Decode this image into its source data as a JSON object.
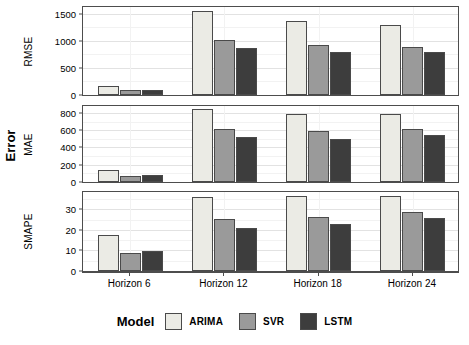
{
  "chart_data": {
    "type": "bar",
    "title": "",
    "subtitle": "",
    "xlabel": "",
    "ylabel": "Error",
    "grid": true,
    "legend": {
      "title": "Model",
      "position": "bottom",
      "entries": [
        {
          "name": "ARIMA",
          "color": "#ebebe5"
        },
        {
          "name": "SVR",
          "color": "#9a9a9a"
        },
        {
          "name": "LSTM",
          "color": "#3d3d3d"
        }
      ]
    },
    "categories": [
      "Horizon 6",
      "Horizon 12",
      "Horizon 18",
      "Horizon 24"
    ],
    "facets": [
      {
        "name": "RMSE",
        "ylim": [
          0,
          1620
        ],
        "ticks": [
          0,
          500,
          1000,
          1500
        ],
        "tick_labels": [
          "0",
          "500",
          "1000",
          "1500"
        ],
        "minor_ticks": [
          250,
          750,
          1250
        ],
        "series": [
          {
            "name": "ARIMA",
            "values": [
              175,
              1540,
              1365,
              1285
            ]
          },
          {
            "name": "SVR",
            "values": [
              95,
              1015,
              915,
              890
            ]
          },
          {
            "name": "LSTM",
            "values": [
              90,
              870,
              790,
              795
            ]
          }
        ]
      },
      {
        "name": "MAE",
        "ylim": [
          0,
          880
        ],
        "ticks": [
          0,
          200,
          400,
          600,
          800
        ],
        "tick_labels": [
          "0",
          "200",
          "400",
          "600",
          "800"
        ],
        "minor_ticks": [
          100,
          300,
          500,
          700
        ],
        "series": [
          {
            "name": "ARIMA",
            "values": [
              140,
              850,
              785,
              788
            ]
          },
          {
            "name": "SVR",
            "values": [
              75,
              618,
              590,
              618
            ]
          },
          {
            "name": "LSTM",
            "values": [
              80,
              520,
              500,
              540
            ]
          }
        ]
      },
      {
        "name": "SMAPE",
        "ylim": [
          0,
          38.5
        ],
        "ticks": [
          0,
          10,
          20,
          30
        ],
        "tick_labels": [
          "0",
          "10",
          "20",
          "30"
        ],
        "minor_ticks": [
          5,
          15,
          25,
          35
        ],
        "series": [
          {
            "name": "ARIMA",
            "values": [
              17.6,
              36.0,
              36.8,
              36.8
            ]
          },
          {
            "name": "SVR",
            "values": [
              9.0,
              25.2,
              26.4,
              28.8
            ]
          },
          {
            "name": "LSTM",
            "values": [
              9.9,
              21.2,
              23.0,
              26.0
            ]
          }
        ]
      }
    ]
  }
}
